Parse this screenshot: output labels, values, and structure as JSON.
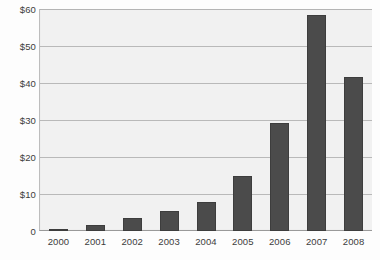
{
  "chart_data": {
    "type": "bar",
    "title": "",
    "xlabel": "",
    "ylabel": "",
    "categories": [
      "2000",
      "2001",
      "2002",
      "2003",
      "2004",
      "2005",
      "2006",
      "2007",
      "2008"
    ],
    "values": [
      0.2,
      1.6,
      3.4,
      5.3,
      7.8,
      15.0,
      29.2,
      58.5,
      41.7
    ],
    "ylim": [
      0,
      60
    ],
    "ytick_values": [
      0,
      10,
      20,
      30,
      40,
      50,
      60
    ],
    "ytick_labels": [
      "0",
      "$10",
      "$20",
      "$30",
      "$40",
      "$50",
      "$60"
    ],
    "grid": true,
    "grid_axis": "y",
    "legend": false,
    "legend_position": "none",
    "series": [
      {
        "name": "Value",
        "values": [
          0.2,
          1.6,
          3.4,
          5.3,
          7.8,
          15.0,
          29.2,
          58.5,
          41.7
        ]
      }
    ]
  },
  "colors": {
    "bar_fill": "#4b4b4b",
    "bar_edge": "#3d3d3d",
    "plot_background": "#f1f1f1",
    "gridline": "#b9b9b9",
    "axis_line": "#9a9a9a",
    "tick_label": "#3c3c3c",
    "page_background": "#fdfdfd"
  },
  "title_fragment": ""
}
